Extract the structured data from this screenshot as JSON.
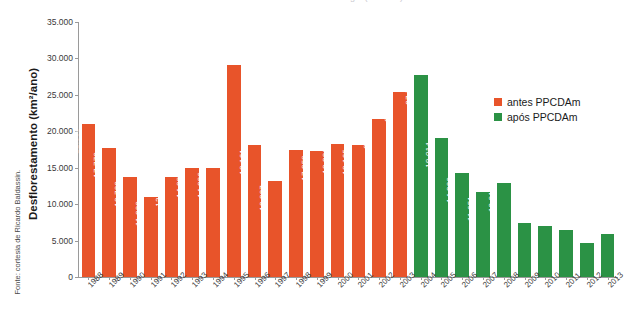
{
  "chart_data": {
    "type": "bar",
    "title": "Desmatamento na Amazônia Legal (km²/ano)",
    "xlabel": "",
    "ylabel": "Desflorestamento (km²/ano)",
    "ylim": [
      0,
      35000
    ],
    "ytick_values": [
      0,
      5000,
      10000,
      15000,
      20000,
      25000,
      30000,
      35000
    ],
    "ytick_labels": [
      "0",
      "5.000",
      "10.000",
      "15.000",
      "20.000",
      "25.000",
      "30.000",
      "35.000"
    ],
    "grid": false,
    "legend_position": "right",
    "categories": [
      "1988",
      "1989",
      "1990",
      "1991",
      "1992",
      "1993",
      "1994",
      "1995",
      "1996",
      "1997",
      "1998",
      "1999",
      "2000",
      "2001",
      "2002",
      "2003",
      "2004",
      "2005",
      "2006",
      "2007",
      "2008",
      "2009",
      "2010",
      "2011",
      "2012",
      "2013"
    ],
    "values": [
      21050,
      17770,
      13730,
      11030,
      13786,
      14896,
      14896,
      29059,
      18161,
      13227,
      17383,
      17259,
      18226,
      18165,
      21651,
      25396,
      27772,
      19014,
      14286,
      11651,
      12911,
      7464,
      7000,
      6418,
      4656,
      5843
    ],
    "value_labels": [
      "21.050",
      "17.770",
      "13.730",
      "11.030",
      "13.786",
      "14.896",
      "14.896",
      "29.059",
      "18.161",
      "13.227",
      "17.383",
      "17.259",
      "18.226",
      "18.165",
      "21.651",
      "25.396",
      "27.772",
      "19.014",
      "14.286",
      "11.651",
      "12.911",
      "7.464",
      "7.000",
      "6.418",
      "4.656",
      "5.843"
    ],
    "series_of_point": [
      "antes",
      "antes",
      "antes",
      "antes",
      "antes",
      "antes",
      "antes",
      "antes",
      "antes",
      "antes",
      "antes",
      "antes",
      "antes",
      "antes",
      "antes",
      "antes",
      "apos",
      "apos",
      "apos",
      "apos",
      "apos",
      "apos",
      "apos",
      "apos",
      "apos",
      "apos"
    ],
    "series": [
      {
        "name": "antes PPCDAm",
        "key": "antes",
        "color": "#e8542a"
      },
      {
        "name": "após PPCDAm",
        "key": "apos",
        "color": "#2b9245"
      }
    ]
  },
  "legend": {
    "items": [
      {
        "label": "antes PPCDAm",
        "color": "#e8542a"
      },
      {
        "label": "após PPCDAm",
        "color": "#2b9245"
      }
    ]
  },
  "source": {
    "credit": "Fonte: cortesia de Ricardo Baldassin."
  },
  "colors": {
    "antes": "#e8542a",
    "apos": "#2b9245",
    "axis": "#9a9a9a",
    "text": "#3a3a3a",
    "background": "#ffffff"
  }
}
